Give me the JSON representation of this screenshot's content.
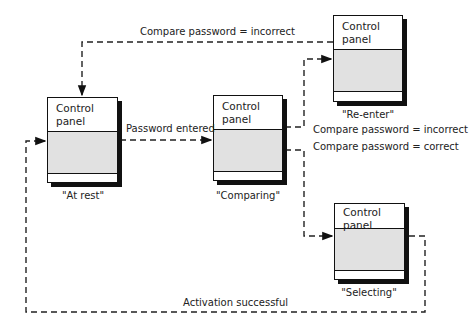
{
  "diagram": {
    "type": "state-transition",
    "states": [
      {
        "id": "at_rest",
        "panel_title": "Control panel",
        "label": "\"At rest\""
      },
      {
        "id": "comparing",
        "panel_title": "Control panel",
        "label": "\"Comparing\""
      },
      {
        "id": "re_enter",
        "panel_title": "Control panel",
        "label": "\"Re-enter\""
      },
      {
        "id": "selecting",
        "panel_title": "Control panel",
        "label": "\"Selecting\""
      }
    ],
    "transitions": [
      {
        "from": "at_rest",
        "to": "comparing",
        "label": "Password entered"
      },
      {
        "from": "comparing",
        "to": "re_enter",
        "label": "Compare password = incorrect"
      },
      {
        "from": "comparing",
        "to": "selecting",
        "label": "Compare password = correct"
      },
      {
        "from": "re_enter",
        "to": "at_rest",
        "label": "Compare password = incorrect"
      },
      {
        "from": "selecting",
        "to": "at_rest",
        "label": "Activation successful"
      }
    ]
  }
}
